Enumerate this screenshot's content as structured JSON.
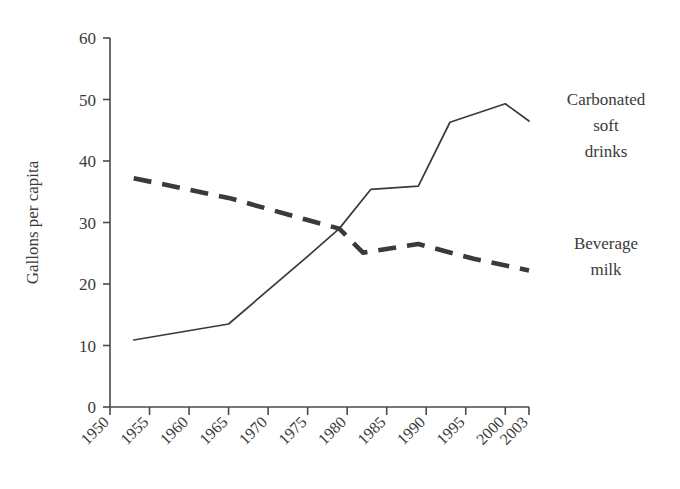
{
  "chart_data": {
    "type": "line",
    "title": "",
    "xlabel": "",
    "ylabel": "Gallons per capita",
    "xlim": [
      1950,
      2003
    ],
    "ylim": [
      0,
      60
    ],
    "grid": false,
    "legend_position": "right-inline-annotations",
    "x_tick_labels": [
      "1950",
      "1955",
      "1960",
      "1965",
      "1970",
      "1975",
      "1980",
      "1985",
      "1990",
      "1995",
      "2000",
      "2003"
    ],
    "x_tick_values": [
      1950,
      1955,
      1960,
      1965,
      1970,
      1975,
      1980,
      1985,
      1990,
      1995,
      2000,
      2003
    ],
    "y_tick_labels": [
      "0",
      "10",
      "20",
      "30",
      "40",
      "50",
      "60"
    ],
    "y_tick_values": [
      0,
      10,
      20,
      30,
      40,
      50,
      60
    ],
    "series": [
      {
        "name": "Carbonated soft drinks",
        "label_lines": [
          "Carbonated",
          "soft",
          "drinks"
        ],
        "style": "solid",
        "color": "#3a3a3a",
        "x": [
          1953,
          1965,
          1975,
          1979,
          1983,
          1989,
          1993,
          2000,
          2003
        ],
        "values": [
          10.9,
          13.5,
          24.5,
          29.0,
          35.4,
          35.9,
          46.3,
          49.3,
          46.5
        ]
      },
      {
        "name": "Beverage milk",
        "label_lines": [
          "Beverage",
          "milk"
        ],
        "style": "dashed",
        "color": "#3a3a3a",
        "x": [
          1953,
          1965,
          1975,
          1979,
          1982,
          1989,
          1996,
          2003
        ],
        "values": [
          37.2,
          34.0,
          30.4,
          29.0,
          25.1,
          26.5,
          24.1,
          22.2
        ]
      }
    ]
  },
  "annotations": {
    "soft_drinks_label": {
      "lines": [
        "Carbonated",
        "soft",
        "drinks"
      ],
      "x": 606,
      "y": 105,
      "line_height": 26
    },
    "milk_label": {
      "lines": [
        "Beverage",
        "milk"
      ],
      "x": 606,
      "y": 249,
      "line_height": 26
    }
  },
  "axis": {
    "y_title": "Gallons per capita"
  }
}
